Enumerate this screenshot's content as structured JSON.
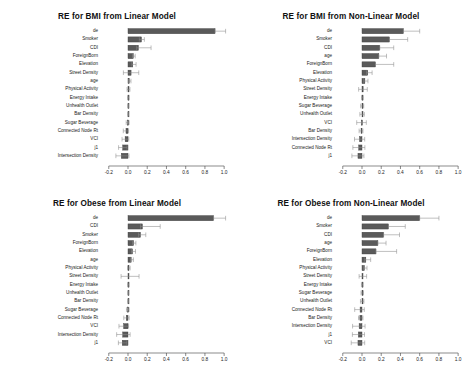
{
  "figure": {
    "background": "#ffffff",
    "bar_fill": "#5a5a5a",
    "bar_stroke": "#3c3c3c",
    "error_color": "#8a8a8a",
    "axis_color": "#3c3c3c",
    "text_color": "#1a1a1a"
  },
  "chart_data": [
    {
      "type": "bar",
      "id": "bmi-linear",
      "title": "RE for BMI from Linear Model",
      "xlabel": "",
      "ylabel": "",
      "orientation": "horizontal",
      "xlim": [
        -0.26,
        1.04
      ],
      "grid": false,
      "legend": "none",
      "tick_labels": [
        "-0.2",
        "0.0",
        "0.2",
        "0.4",
        "0.6",
        "0.8",
        "1.0"
      ],
      "ticks": [
        -0.2,
        0.0,
        0.2,
        0.4,
        0.6,
        0.8,
        1.0
      ],
      "categories": [
        "de",
        "Smoker",
        "CDI",
        "ForeignBorn",
        "Elevation",
        "Street Density",
        "age",
        "Physical Activity",
        "Energy Intake",
        "Unhealth Outlet",
        "Bar Density",
        "Sugar Beverage",
        "Connected Node Rt",
        "VCI",
        "j1",
        "Intersection Density"
      ],
      "values": [
        0.905,
        0.14,
        0.108,
        0.055,
        0.05,
        0.032,
        0.013,
        0.004,
        0.002,
        0.001,
        0.001,
        -0.004,
        -0.021,
        -0.03,
        -0.055,
        -0.07
      ],
      "err_low": [
        0.905,
        0.118,
        0.09,
        0.046,
        0.04,
        -0.048,
        0.005,
        -0.01,
        -0.004,
        -0.003,
        -0.004,
        -0.019,
        -0.049,
        -0.062,
        -0.098,
        -0.126
      ],
      "err_high": [
        1.015,
        0.17,
        0.24,
        0.075,
        0.084,
        0.112,
        0.031,
        0.02,
        0.01,
        0.006,
        0.006,
        0.012,
        0.006,
        0.008,
        -0.01,
        0.01
      ]
    },
    {
      "type": "bar",
      "id": "bmi-nonlinear",
      "title": "RE for BMI from Non-Linear Model",
      "xlabel": "",
      "ylabel": "",
      "orientation": "horizontal",
      "xlim": [
        -0.26,
        1.04
      ],
      "grid": false,
      "legend": "none",
      "tick_labels": [
        "-0.2",
        "0.0",
        "0.2",
        "0.4",
        "0.6",
        "0.8",
        "1.0"
      ],
      "ticks": [
        -0.2,
        0.0,
        0.2,
        0.4,
        0.6,
        0.8,
        1.0
      ],
      "categories": [
        "de",
        "Smoker",
        "CDI",
        "age",
        "ForeignBorn",
        "Elevation",
        "Physical Activity",
        "Street Density",
        "Energy Intake",
        "Sugar Beverage",
        "Unhealth Outlet",
        "VCI",
        "Bar Density",
        "Intersection Density",
        "Connected Node Rt",
        "j1"
      ],
      "values": [
        0.43,
        0.285,
        0.185,
        0.175,
        0.14,
        0.06,
        0.03,
        0.012,
        0.003,
        0.002,
        0.001,
        -0.006,
        -0.01,
        -0.026,
        -0.034,
        -0.042
      ],
      "err_low": [
        0.43,
        0.285,
        0.185,
        0.175,
        0.14,
        0.046,
        0.018,
        -0.035,
        -0.004,
        -0.014,
        -0.022,
        -0.055,
        -0.03,
        -0.078,
        -0.095,
        -0.105
      ],
      "err_high": [
        0.6,
        0.475,
        0.33,
        0.255,
        0.33,
        0.105,
        0.062,
        0.055,
        0.012,
        0.018,
        0.024,
        0.045,
        0.01,
        0.028,
        0.03,
        0.02
      ]
    },
    {
      "type": "bar",
      "id": "obese-linear",
      "title": "RE for Obese from Linear Model",
      "xlabel": "",
      "ylabel": "",
      "orientation": "horizontal",
      "xlim": [
        -0.26,
        1.04
      ],
      "grid": false,
      "legend": "none",
      "tick_labels": [
        "-0.2",
        "0.0",
        "0.2",
        "0.4",
        "0.6",
        "0.8",
        "1.0"
      ],
      "ticks": [
        -0.2,
        0.0,
        0.2,
        0.4,
        0.6,
        0.8,
        1.0
      ],
      "categories": [
        "de",
        "CDI",
        "Smoker",
        "ForeignBorn",
        "Elevation",
        "age",
        "Physical Activity",
        "Street Density",
        "Energy Intake",
        "Unhealth Outlet",
        "Bar Density",
        "Sugar Beverage",
        "Connected Node Rt",
        "VCI",
        "Intersection Density",
        "j1"
      ],
      "values": [
        0.89,
        0.15,
        0.13,
        0.058,
        0.047,
        0.033,
        0.008,
        0.003,
        0.002,
        0.001,
        0.001,
        -0.003,
        -0.018,
        -0.046,
        -0.055,
        -0.06
      ],
      "err_low": [
        0.89,
        0.13,
        0.11,
        0.048,
        0.036,
        0.026,
        -0.004,
        -0.072,
        -0.004,
        -0.003,
        -0.004,
        -0.016,
        -0.044,
        -0.094,
        -0.118,
        -0.1
      ],
      "err_high": [
        1.015,
        0.335,
        0.185,
        0.082,
        0.078,
        0.056,
        0.022,
        0.115,
        0.01,
        0.006,
        0.006,
        0.012,
        0.012,
        0.006,
        0.022,
        -0.012
      ]
    },
    {
      "type": "bar",
      "id": "obese-nonlinear",
      "title": "RE for Obese from Non-Linear Model",
      "xlabel": "",
      "ylabel": "",
      "orientation": "horizontal",
      "xlim": [
        -0.26,
        1.04
      ],
      "grid": false,
      "legend": "none",
      "tick_labels": [
        "-0.2",
        "0.0",
        "0.2",
        "0.4",
        "0.6",
        "0.8",
        "1.0"
      ],
      "ticks": [
        -0.2,
        0.0,
        0.2,
        0.4,
        0.6,
        0.8,
        1.0
      ],
      "categories": [
        "de",
        "Smoker",
        "CDI",
        "age",
        "ForeignBorn",
        "Elevation",
        "Physical Activity",
        "Street Density",
        "Energy Intake",
        "Sugar Beverage",
        "Unhealth Outlet",
        "Connected Node Rt",
        "Bar Density",
        "Intersection Density",
        "j1",
        "VCI"
      ],
      "values": [
        0.6,
        0.275,
        0.225,
        0.165,
        0.145,
        0.04,
        0.025,
        0.01,
        0.002,
        0.001,
        0.001,
        -0.02,
        -0.022,
        -0.03,
        -0.038,
        -0.042
      ],
      "err_low": [
        0.6,
        0.275,
        0.225,
        0.165,
        0.145,
        0.028,
        0.014,
        -0.03,
        -0.006,
        -0.01,
        -0.016,
        -0.076,
        -0.036,
        -0.098,
        -0.1,
        -0.112
      ],
      "err_high": [
        0.8,
        0.45,
        0.39,
        0.25,
        0.36,
        0.09,
        0.052,
        0.048,
        0.01,
        0.014,
        0.02,
        0.024,
        0.01,
        0.032,
        0.026,
        0.028
      ]
    }
  ]
}
